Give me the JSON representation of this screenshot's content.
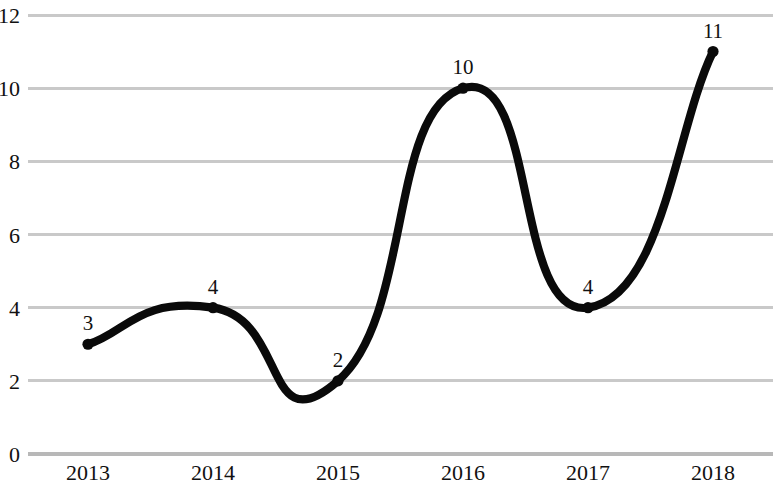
{
  "chart_data": {
    "type": "line",
    "title": "",
    "subtitle": "",
    "xlabel": "",
    "ylabel": "",
    "categories": [
      "2013",
      "2014",
      "2015",
      "2016",
      "2017",
      "2018"
    ],
    "values": [
      3,
      4,
      2,
      10,
      4,
      11
    ],
    "point_labels": [
      "3",
      "4",
      "2",
      "10",
      "4",
      "11"
    ],
    "series": [
      {
        "name": "",
        "values": [
          3,
          4,
          2,
          10,
          4,
          11
        ]
      }
    ],
    "ylim": [
      0,
      12
    ],
    "yticks": [
      0,
      2,
      4,
      6,
      8,
      10,
      12
    ],
    "ytick_labels": [
      "0",
      "2",
      "4",
      "6",
      "8",
      "10",
      "12"
    ],
    "xtick_labels": [
      "2013",
      "2014",
      "2015",
      "2016",
      "2017",
      "2018"
    ],
    "grid": true,
    "grid_axis": "y",
    "legend": false,
    "legend_position": "none",
    "smoothing": "spline",
    "markers": true,
    "data_labels": true,
    "colors": {
      "line": "#0a0a0a",
      "marker": "#0a0a0a",
      "gridline": "#c9c9c9",
      "axis": "#b8b8b8",
      "text": "#111111",
      "background": "#ffffff"
    }
  },
  "axis": {
    "y_labels": [
      "12",
      "10",
      "8",
      "6",
      "4",
      "2",
      "0"
    ],
    "x_labels": [
      "2013",
      "2014",
      "2015",
      "2016",
      "2017",
      "2018"
    ]
  },
  "points": [
    {
      "category": "2013",
      "value": 3,
      "label": "3"
    },
    {
      "category": "2014",
      "value": 4,
      "label": "4"
    },
    {
      "category": "2015",
      "value": 2,
      "label": "2"
    },
    {
      "category": "2016",
      "value": 10,
      "label": "10"
    },
    {
      "category": "2017",
      "value": 4,
      "label": "4"
    },
    {
      "category": "2018",
      "value": 11,
      "label": "11"
    }
  ]
}
